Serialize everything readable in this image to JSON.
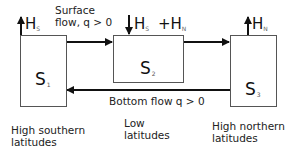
{
  "boxes": [
    {
      "id": "s1",
      "name": "S",
      "sub": "1",
      "region": "High southern\nlatitudes"
    },
    {
      "id": "s2",
      "name": "S",
      "sub": "2",
      "region": "Low\nlatitudes"
    },
    {
      "id": "s3",
      "name": "S",
      "sub": "3",
      "region": "High northern\nlatitudes"
    }
  ],
  "fluxes": {
    "s1_flux": {
      "symbol": "H",
      "sub": "S",
      "direction": "up"
    },
    "s2_flux_a": {
      "symbol": "H",
      "sub": "S",
      "direction": "down"
    },
    "s2_flux_b": {
      "prefix": "+H",
      "sub": "N"
    },
    "s3_flux": {
      "symbol": "H",
      "sub": "N",
      "direction": "up"
    }
  },
  "flows": {
    "surface": "Surface\nflow, q > 0",
    "bottom": "Bottom flow q > 0"
  },
  "colors": {
    "line": "#111111",
    "box_border": "#555555",
    "text": "#222222"
  }
}
